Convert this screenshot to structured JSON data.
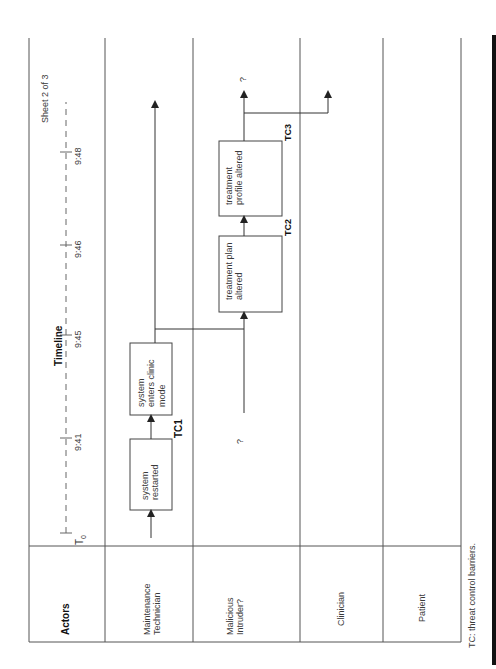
{
  "sheet": {
    "label": "Sheet 2 of 3"
  },
  "timeline": {
    "title": "Timeline",
    "start_label": "T",
    "start_subscript": "0",
    "ticks": [
      "9:41",
      "9:45",
      "9:46",
      "9:48"
    ]
  },
  "actors": {
    "header": "Actors",
    "lanes": [
      {
        "line1": "Maintenance",
        "line2": "Technician"
      },
      {
        "line1": "Malicious",
        "line2": "Intruder?"
      },
      {
        "line1": "Clinician",
        "line2": ""
      },
      {
        "line1": "Patient",
        "line2": ""
      }
    ]
  },
  "events": [
    {
      "id": "e1",
      "line1": "system",
      "line2": "restarted",
      "line3": ""
    },
    {
      "id": "e2",
      "line1": "system",
      "line2": "enters clinic",
      "line3": "mode"
    },
    {
      "id": "e3",
      "line1": "treatment plan",
      "line2": "altered",
      "line3": ""
    },
    {
      "id": "e4",
      "line1": "treatment",
      "line2": "profile altered",
      "line3": ""
    }
  ],
  "barriers": [
    "TC1",
    "TC2",
    "TC3"
  ],
  "unknown_markers": [
    "?",
    "?"
  ],
  "footnote": "TC:  threat control barriers.",
  "colors": {
    "line": "#3a3a3a",
    "text": "#3a3a3a",
    "edge_bar": "#111111"
  }
}
